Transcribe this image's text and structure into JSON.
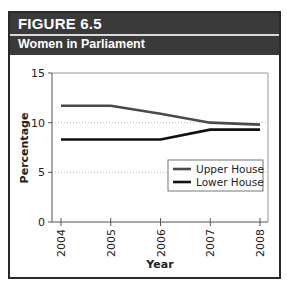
{
  "figure": {
    "number_label": "FIGURE 6.5",
    "subtitle": "Women in Parliament"
  },
  "colors": {
    "header_bg": "#3a3a3a",
    "upper_house": "#4a4a4a",
    "lower_house": "#111111"
  },
  "chart_data": {
    "type": "line",
    "title": "Women in Parliament",
    "xlabel": "Year",
    "ylabel": "Percentage",
    "x": [
      "2004",
      "2005",
      "2006",
      "2007",
      "2008"
    ],
    "ylim": [
      0,
      15
    ],
    "yticks": [
      0,
      5,
      10,
      15
    ],
    "grid": "horizontal dotted at 5 and 10",
    "legend_position": "right",
    "series": [
      {
        "name": "Upper House",
        "values": [
          11.7,
          11.7,
          10.9,
          10.0,
          9.8
        ]
      },
      {
        "name": "Lower House",
        "values": [
          8.3,
          8.3,
          8.3,
          9.3,
          9.3
        ]
      }
    ]
  }
}
